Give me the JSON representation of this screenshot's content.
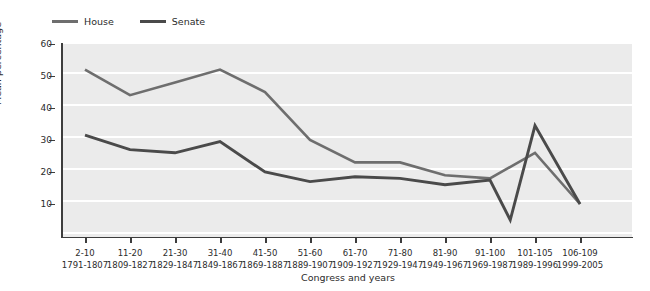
{
  "legend": {
    "position": "top-left",
    "items": [
      {
        "label": "House",
        "color": "#6e6e6e"
      },
      {
        "label": "Senate",
        "color": "#4a4a4a"
      }
    ]
  },
  "axes": {
    "y": {
      "title": "Mean percentage",
      "ticks": [
        60,
        50,
        40,
        30,
        20,
        10
      ],
      "min": 0,
      "max": 60
    },
    "x": {
      "title": "Congress and years"
    }
  },
  "chart_data": {
    "type": "line",
    "title": "",
    "subtitle": "",
    "xlabel": "Congress and years",
    "ylabel": "Mean percentage",
    "ylim": [
      0,
      60
    ],
    "grid": true,
    "legend_position": "top-left",
    "categories": [
      "2-10",
      "11-20",
      "21-30",
      "31-40",
      "41-50",
      "51-60",
      "61-70",
      "71-80",
      "81-90",
      "91-100",
      "101-105",
      "106-109"
    ],
    "category_years": [
      "1791-1807",
      "1809-1827",
      "1829-1847",
      "1849-1867",
      "1869-1887",
      "1889-1907",
      "1909-1927",
      "1929-1947",
      "1949-1967",
      "1969-1987",
      "1989-1996",
      "1999-2005"
    ],
    "series": [
      {
        "name": "House",
        "color": "#6e6e6e",
        "values": [
          52,
          44,
          48,
          52,
          45,
          30,
          23,
          23,
          19,
          18,
          26,
          10
        ]
      },
      {
        "name": "Senate",
        "color": "#4a4a4a",
        "values": [
          31.5,
          27,
          26,
          29.5,
          20,
          17,
          18.5,
          18,
          16,
          17.5,
          34.5,
          10
        ]
      }
    ],
    "senate_extra_points": [
      {
        "after_category": "91-100",
        "value": 5,
        "note": "dip between 91-100 and 101-105"
      }
    ]
  }
}
